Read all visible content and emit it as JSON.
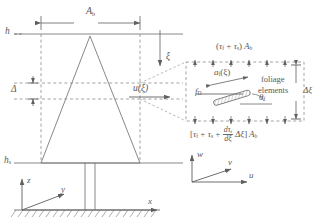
{
  "figure": {
    "type": "canopy-drag-schematic"
  },
  "labels": {
    "crown_width": "A",
    "crown_width_sub": "b",
    "canopy_top_height": "h",
    "trunk_space_height": "h",
    "trunk_space_height_sub": "s",
    "layer_thickness_left": "Δ",
    "layer_thickness_right": "Δξ",
    "vertical_coordinate": "ξ",
    "velocity_profile": "u(ξ)",
    "drag_force": "f",
    "drag_force_sub": "D",
    "element_area": "a",
    "element_area_sub": "f",
    "element_area_arg": "(ξ)",
    "element_angle": "θ",
    "element_angle_sub": "f",
    "foliage_elements_line1": "foliage",
    "foliage_elements_line2": "elements"
  },
  "equations": {
    "top_stress": {
      "parts": [
        "(",
        "τ",
        "f",
        " + ",
        "τ",
        "s",
        ")",
        "A",
        "b"
      ],
      "plain": "(τf + τs) Ab"
    },
    "bottom_stress": {
      "open_bracket": "[",
      "tau_f": "τ",
      "tau_f_sub": "f",
      "plus1": "+",
      "tau_s": "τ",
      "tau_s_sub": "s",
      "frac_num": "dτ",
      "frac_num_sub": "f",
      "frac_den": "dξ",
      "delta_xi": "Δξ",
      "close_bracket": "]",
      "area": "A",
      "area_sub": "b",
      "plain": "[τf + τs + (dτf/dξ) Δξ] Ab"
    }
  },
  "axes": {
    "spatial": {
      "vertical": "z",
      "lateral": "y",
      "streamwise": "x"
    },
    "velocity": {
      "vertical": "w",
      "lateral": "v",
      "streamwise": "u"
    }
  },
  "colors": {
    "line": "#6a6a6a",
    "dashed": "#8c8c8c",
    "text": "#5a5a5a",
    "background": "#ffffff"
  }
}
